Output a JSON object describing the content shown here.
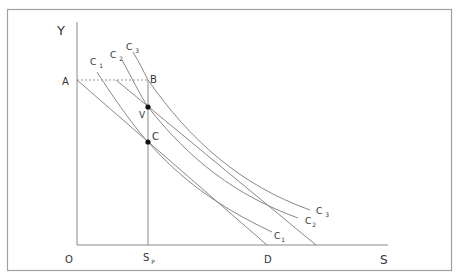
{
  "diagram": {
    "axes": {
      "y_label": "Y",
      "x_label": "S",
      "origin_label": "O"
    },
    "points": {
      "A": "A",
      "B": "B",
      "C": "C",
      "V": "V",
      "D": "D"
    },
    "sp_label": {
      "main": "S",
      "sub": "P"
    },
    "curves": [
      {
        "name": "C",
        "sub": "1"
      },
      {
        "name": "C",
        "sub": "2"
      },
      {
        "name": "C",
        "sub": "3"
      }
    ],
    "colors": {
      "line": "#888888",
      "text": "#333333",
      "frame": "#999999",
      "dot": "#111111"
    }
  }
}
